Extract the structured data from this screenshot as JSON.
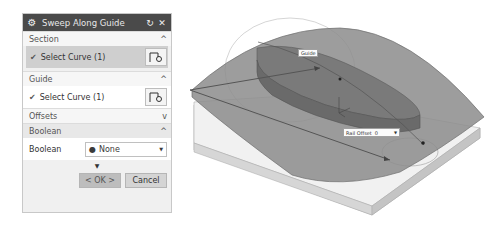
{
  "dialog": {
    "title": "Sweep Along Guide",
    "reset_icon": "reset-icon",
    "close_icon": "close-icon",
    "groups": {
      "section": {
        "label": "Section",
        "state": "expanded",
        "select_label": "Select Curve (1)"
      },
      "guide": {
        "label": "Guide",
        "state": "expanded",
        "select_label": "Select Curve (1)"
      },
      "offsets": {
        "label": "Offsets",
        "state": "collapsed"
      },
      "boolean": {
        "label": "Boolean",
        "state": "expanded",
        "field_label": "Boolean",
        "value": "None"
      }
    },
    "chevron_up": "^",
    "chevron_down": "v",
    "check": "✔",
    "more_arrow": "▼",
    "ok_label": "< OK >",
    "cancel_label": "Cancel"
  },
  "viewport": {
    "guide_callout": "Guide",
    "rail_offset": {
      "label": "Rail Offset",
      "value": "0"
    },
    "colors": {
      "surface": "#8a8a8a",
      "block_top": "#f2f2f2",
      "block_side": "#cfcfcf",
      "solid": "#7a7a7a"
    }
  }
}
